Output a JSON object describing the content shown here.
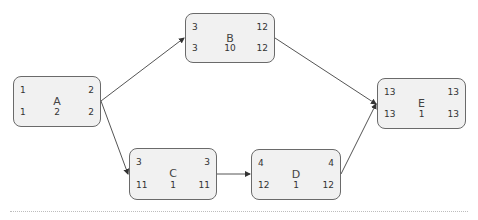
{
  "diagram": {
    "type": "activity-on-node network",
    "nodes": [
      {
        "id": "A",
        "top_left": "1",
        "top_right": "2",
        "bottom_left": "1",
        "bottom_middle": "2",
        "bottom_right": "2"
      },
      {
        "id": "B",
        "top_left": "3",
        "top_right": "12",
        "bottom_left": "3",
        "bottom_middle": "10",
        "bottom_right": "12"
      },
      {
        "id": "C",
        "top_left": "3",
        "top_right": "3",
        "bottom_left": "11",
        "bottom_middle": "1",
        "bottom_right": "11"
      },
      {
        "id": "D",
        "top_left": "4",
        "top_right": "4",
        "bottom_left": "12",
        "bottom_middle": "1",
        "bottom_right": "12"
      },
      {
        "id": "E",
        "top_left": "13",
        "top_right": "13",
        "bottom_left": "13",
        "bottom_middle": "1",
        "bottom_right": "13"
      }
    ],
    "edges": [
      {
        "from": "A",
        "to": "B"
      },
      {
        "from": "A",
        "to": "C"
      },
      {
        "from": "C",
        "to": "D"
      },
      {
        "from": "B",
        "to": "E"
      },
      {
        "from": "D",
        "to": "E"
      }
    ],
    "colors": {
      "node_fill": "#f1f1f1",
      "node_border": "#6a6a6a",
      "edge": "#555555"
    }
  }
}
